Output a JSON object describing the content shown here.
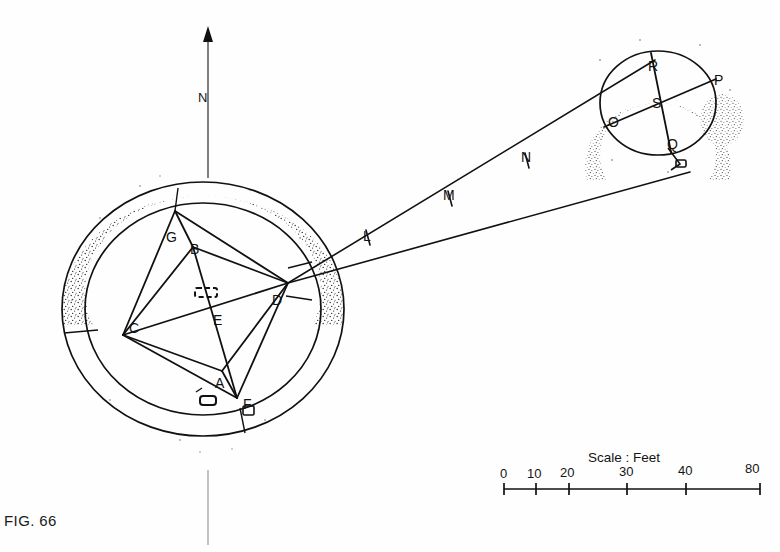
{
  "figure": {
    "caption": "FIG. 66",
    "north_label": "N"
  },
  "scale": {
    "title": "Scale : Feet",
    "unit": "Feet",
    "ticks": [
      {
        "label": "0",
        "x": 504
      },
      {
        "label": "10",
        "x": 536
      },
      {
        "label": "20",
        "x": 569
      },
      {
        "label": "30",
        "x": 627
      },
      {
        "label": "40",
        "x": 686
      },
      {
        "label": "80",
        "x": 745
      }
    ]
  },
  "main_circle": {
    "name": "large-stone-circle",
    "station_labels": [
      {
        "id": "A",
        "label": "A",
        "x": 215,
        "y": 383
      },
      {
        "id": "B",
        "label": "B",
        "x": 190,
        "y": 249
      },
      {
        "id": "C",
        "label": "C",
        "x": 129,
        "y": 328
      },
      {
        "id": "D",
        "label": "D",
        "x": 272,
        "y": 300
      },
      {
        "id": "E",
        "label": "E",
        "x": 213,
        "y": 320
      },
      {
        "id": "F",
        "label": "F",
        "x": 243,
        "y": 404
      },
      {
        "id": "G",
        "label": "G",
        "x": 166,
        "y": 237
      }
    ]
  },
  "secondary_circle": {
    "name": "small-stone-circle",
    "station_labels": [
      {
        "id": "O",
        "label": "O",
        "x": 608,
        "y": 122
      },
      {
        "id": "P",
        "label": "P",
        "x": 714,
        "y": 80
      },
      {
        "id": "Q",
        "label": "Q",
        "x": 667,
        "y": 144
      },
      {
        "id": "R",
        "label": "R",
        "x": 648,
        "y": 66
      },
      {
        "id": "S",
        "label": "S",
        "x": 652,
        "y": 103
      }
    ]
  },
  "sight_line": {
    "name": "survey-traverse",
    "station_labels": [
      {
        "id": "L",
        "label": "L",
        "x": 363,
        "y": 236
      },
      {
        "id": "M",
        "label": "M",
        "x": 443,
        "y": 195
      },
      {
        "id": "N",
        "label": "N",
        "x": 521,
        "y": 157
      }
    ]
  }
}
